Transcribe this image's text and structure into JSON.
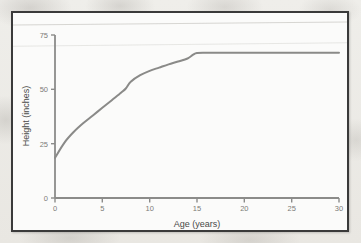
{
  "figure": {
    "kind": "scanned-textbook-figure",
    "frame_border_color": "#3a3a3a",
    "plot_background": "#fbfbfa"
  },
  "chart_data": {
    "type": "line",
    "title": "",
    "subtitle": "",
    "xlabel": "Age (years)",
    "ylabel": "Height (inches)",
    "xlim": [
      0,
      30
    ],
    "ylim": [
      0,
      75
    ],
    "xticks": [
      0,
      5,
      10,
      15,
      20,
      25,
      30
    ],
    "xtick_labels": [
      "0",
      "5",
      "10",
      "15",
      "20",
      "25",
      "30"
    ],
    "yticks": [
      0,
      25,
      50,
      75
    ],
    "ytick_labels": [
      "0",
      "25",
      "50",
      "75"
    ],
    "grid": false,
    "legend": null,
    "legend_position": "none",
    "line_color": "#8a8a88",
    "line_width": 2.0,
    "annotations": [],
    "series": [
      {
        "name": "Height",
        "x": [
          0,
          1,
          2,
          3,
          4,
          5,
          6,
          7,
          7.5,
          8,
          9,
          10,
          11,
          12,
          13,
          14,
          14.6,
          15,
          16,
          18,
          20,
          22,
          24,
          26,
          28,
          30
        ],
        "y": [
          18.5,
          25.5,
          30.5,
          34.5,
          38.0,
          41.5,
          45.0,
          48.5,
          50.5,
          53.5,
          56.5,
          58.5,
          60.0,
          61.5,
          62.8,
          64.2,
          66.0,
          66.7,
          66.8,
          66.8,
          66.8,
          66.8,
          66.8,
          66.8,
          66.8,
          66.8
        ]
      }
    ]
  }
}
